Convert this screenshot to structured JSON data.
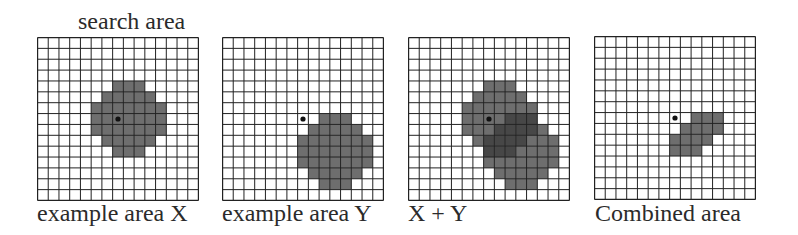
{
  "figure": {
    "top_label": "search area",
    "grid_size": 15,
    "colors": {
      "background": "#ffffff",
      "grid_line": "#222222",
      "fill": "#6e6e6e",
      "overlap": "#474747",
      "dot": "#111111"
    },
    "panels": [
      {
        "id": "example-area-x",
        "label": "example area X",
        "dot": {
          "col": 7,
          "row": 7
        },
        "cells": {
          "4": [
            7,
            9
          ],
          "5": [
            6,
            10
          ],
          "6": [
            5,
            11
          ],
          "7": [
            5,
            11
          ],
          "8": [
            5,
            11
          ],
          "9": [
            6,
            10
          ],
          "10": [
            7,
            9
          ]
        }
      },
      {
        "id": "example-area-y",
        "label": "example area Y",
        "dot": {
          "col": 7,
          "row": 7
        },
        "cells": {
          "7": [
            9,
            11
          ],
          "8": [
            8,
            12
          ],
          "9": [
            7,
            13
          ],
          "10": [
            7,
            13
          ],
          "11": [
            7,
            13
          ],
          "12": [
            8,
            12
          ],
          "13": [
            9,
            11
          ]
        }
      },
      {
        "id": "x-plus-y",
        "label": "X + Y",
        "dot": {
          "col": 7,
          "row": 7
        },
        "overlay_of": [
          "example-area-x",
          "example-area-y"
        ]
      },
      {
        "id": "combined-area",
        "label": "Combined area",
        "dot": {
          "col": 7,
          "row": 7
        },
        "cells": {
          "7": [
            9,
            11
          ],
          "8": [
            8,
            11
          ],
          "9": [
            7,
            10
          ],
          "10": [
            7,
            9
          ]
        }
      }
    ]
  }
}
